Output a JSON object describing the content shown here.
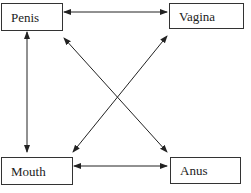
{
  "nodes": {
    "penis": {
      "label": "Penis"
    },
    "vagina": {
      "label": "Vagina"
    },
    "mouth": {
      "label": "Mouth"
    },
    "anus": {
      "label": "Anus"
    }
  },
  "edges": [
    {
      "from": "Penis",
      "to": "Vagina",
      "type": "bidirectional"
    },
    {
      "from": "Penis",
      "to": "Mouth",
      "type": "bidirectional"
    },
    {
      "from": "Penis",
      "to": "Anus",
      "type": "bidirectional"
    },
    {
      "from": "Vagina",
      "to": "Mouth",
      "type": "bidirectional"
    },
    {
      "from": "Mouth",
      "to": "Anus",
      "type": "bidirectional"
    }
  ]
}
